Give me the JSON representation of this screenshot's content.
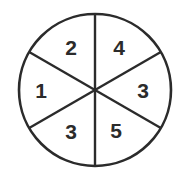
{
  "diagram": {
    "type": "spinner",
    "sector_count": 6,
    "center": [
      95,
      90
    ],
    "radius": 76,
    "stroke_color": "#2b2b2b",
    "background_color": "#ffffff",
    "sectors": [
      {
        "position": "upper-left",
        "label": "2"
      },
      {
        "position": "upper-right",
        "label": "4"
      },
      {
        "position": "right",
        "label": "3"
      },
      {
        "position": "lower-right",
        "label": "5"
      },
      {
        "position": "lower-left",
        "label": "3"
      },
      {
        "position": "left",
        "label": "1"
      }
    ]
  }
}
